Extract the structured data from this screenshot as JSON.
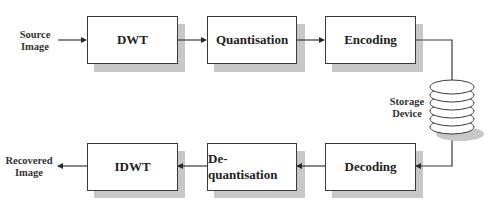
{
  "diagram": {
    "inputs": {
      "source": [
        "Source",
        "Image"
      ],
      "recovered": [
        "Recovered",
        "Image"
      ],
      "storage": [
        "Storage",
        "Device"
      ]
    },
    "top_row": [
      {
        "id": "dwt",
        "label": "DWT"
      },
      {
        "id": "quantisation",
        "label": "Quantisation"
      },
      {
        "id": "encoding",
        "label": "Encoding"
      }
    ],
    "bottom_row": [
      {
        "id": "idwt",
        "label": "IDWT"
      },
      {
        "id": "dequantisation",
        "label": "De-quantisation"
      },
      {
        "id": "decoding",
        "label": "Decoding"
      }
    ],
    "flow": [
      [
        "Source Image",
        "DWT"
      ],
      [
        "DWT",
        "Quantisation"
      ],
      [
        "Quantisation",
        "Encoding"
      ],
      [
        "Encoding",
        "Storage Device"
      ],
      [
        "Storage Device",
        "Decoding"
      ],
      [
        "Decoding",
        "De-quantisation"
      ],
      [
        "De-quantisation",
        "IDWT"
      ],
      [
        "IDWT",
        "Recovered Image"
      ]
    ],
    "colors": {
      "line": "#3a3a3a",
      "shadow": "#c8c8c8",
      "box_fill": "#ffffff"
    }
  }
}
